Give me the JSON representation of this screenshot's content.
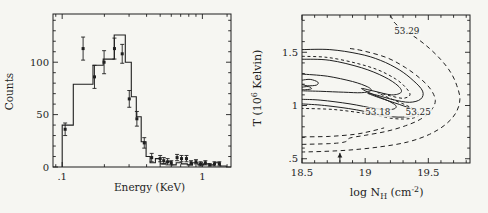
{
  "figure": {
    "background": "#f6f6f2",
    "ink": "#1f1f1f"
  },
  "chart_data": [
    {
      "type": "bar",
      "subtype": "step-histogram-with-errorbar-points",
      "panel": "left",
      "title": "",
      "xlabel": "Energy (KeV)",
      "ylabel": "Counts",
      "xscale": "log",
      "xlim": [
        0.086,
        1.6
      ],
      "ylim": [
        0,
        146
      ],
      "grid": false,
      "xticks_major": [
        {
          "value": 0.1,
          "label": ".1"
        },
        {
          "value": 1,
          "label": "1"
        }
      ],
      "xticks_minor": [
        0.09,
        0.2,
        0.3,
        0.4,
        0.5,
        0.6,
        0.7,
        0.8,
        0.9,
        1.5
      ],
      "yticks_major": [
        {
          "value": 0,
          "label": "0"
        },
        {
          "value": 50,
          "label": "50"
        },
        {
          "value": 100,
          "label": "100"
        }
      ],
      "yticks_minor": [
        10,
        20,
        30,
        40,
        60,
        70,
        80,
        90,
        110,
        120,
        130,
        140
      ],
      "histogram": {
        "bin_edges": [
          0.1,
          0.12,
          0.166,
          0.196,
          0.235,
          0.282,
          0.311,
          0.338,
          0.366,
          0.397,
          0.424,
          0.462,
          0.5,
          0.55,
          0.6,
          0.65,
          0.71,
          0.78,
          0.85,
          0.93,
          1.02,
          1.12,
          1.22,
          1.34,
          1.48
        ],
        "counts": [
          40,
          79,
          97,
          103,
          126,
          100,
          67,
          48,
          24,
          10,
          4,
          8,
          3,
          5,
          2,
          4,
          3,
          2,
          4,
          2,
          3,
          2,
          4,
          1
        ]
      },
      "points": {
        "x": [
          0.105,
          0.141,
          0.17,
          0.199,
          0.236,
          0.268,
          0.301,
          0.341,
          0.385,
          0.435,
          0.5,
          0.53,
          0.565,
          0.6,
          0.66,
          0.71,
          0.77,
          0.83,
          0.9,
          0.97,
          1.05,
          1.13,
          1.22,
          1.32
        ],
        "y": [
          36,
          113,
          86,
          100,
          113,
          108,
          65,
          46,
          23,
          9,
          8,
          6,
          5,
          4,
          9,
          8,
          8,
          4,
          5,
          3,
          4,
          2,
          3,
          3
        ],
        "yerr": [
          6,
          11,
          11,
          11,
          10,
          9,
          8,
          7,
          5,
          4,
          3,
          3,
          3,
          2,
          3,
          3,
          3,
          2,
          2,
          2,
          2,
          1,
          2,
          2
        ]
      }
    },
    {
      "type": "line",
      "subtype": "contour-map",
      "panel": "right",
      "title": "",
      "xlabel": "log N_H (cm^-2)",
      "xlabel_parts": [
        {
          "t": "log N"
        },
        {
          "t": "H",
          "shift": "sub"
        },
        {
          "t": " (cm"
        },
        {
          "t": "-2",
          "shift": "sup"
        },
        {
          "t": ")"
        }
      ],
      "ylabel": "T (10^6 Kelvin)",
      "ylabel_parts": [
        {
          "t": "T (10"
        },
        {
          "t": "6",
          "shift": "sup"
        },
        {
          "t": " Kelvin)"
        }
      ],
      "xlim": [
        18.5,
        19.83
      ],
      "ylim": [
        0.46,
        1.85
      ],
      "grid": false,
      "xticks_major": [
        {
          "value": 18.5,
          "label": "18.5"
        },
        {
          "value": 19,
          "label": "19"
        },
        {
          "value": 19.5,
          "label": "19.5"
        }
      ],
      "xticks_minor": [
        18.6,
        18.7,
        18.8,
        18.9,
        19.1,
        19.2,
        19.3,
        19.4,
        19.6,
        19.7,
        19.8
      ],
      "yticks_major": [
        {
          "value": 0.5,
          "label": ".5"
        },
        {
          "value": 1,
          "label": "1"
        },
        {
          "value": 1.5,
          "label": "1.5"
        }
      ],
      "yticks_minor": [
        0.6,
        0.7,
        0.8,
        0.9,
        1.1,
        1.2,
        1.3,
        1.4,
        1.6,
        1.7,
        1.8
      ],
      "contour_labels": [
        {
          "text": "53.29",
          "x": 19.33,
          "y": 1.7
        },
        {
          "text": "53.18",
          "x": 19.1,
          "y": 0.935
        },
        {
          "text": "53.25",
          "x": 19.42,
          "y": 0.935
        }
      ],
      "arrow_marker": {
        "x": 18.8,
        "y_base": 0.468,
        "y_tip": 0.555
      },
      "contours": [
        {
          "id": "solid-outer",
          "style": "solid",
          "points": [
            [
              18.5,
              1.525
            ],
            [
              18.72,
              1.525
            ],
            [
              18.95,
              1.485
            ],
            [
              19.12,
              1.425
            ],
            [
              19.27,
              1.335
            ],
            [
              19.38,
              1.235
            ],
            [
              19.455,
              1.135
            ],
            [
              19.44,
              1.06
            ],
            [
              19.35,
              1.03
            ],
            [
              19.22,
              1.055
            ],
            [
              19.1,
              1.095
            ],
            [
              19.02,
              1.115
            ],
            [
              19.12,
              1.07
            ],
            [
              19.27,
              1.01
            ],
            [
              19.37,
              0.965
            ],
            [
              19.405,
              0.925
            ],
            [
              19.33,
              0.893
            ],
            [
              19.17,
              0.9
            ],
            [
              18.93,
              0.96
            ],
            [
              18.68,
              1.0
            ],
            [
              18.5,
              1.015
            ]
          ]
        },
        {
          "id": "solid-middle",
          "style": "solid",
          "points": [
            [
              18.5,
              1.435
            ],
            [
              18.72,
              1.425
            ],
            [
              18.97,
              1.355
            ],
            [
              19.15,
              1.27
            ],
            [
              19.26,
              1.185
            ],
            [
              19.285,
              1.125
            ],
            [
              19.21,
              1.1
            ],
            [
              19.07,
              1.135
            ],
            [
              18.97,
              1.16
            ],
            [
              19.06,
              1.105
            ],
            [
              19.18,
              1.045
            ],
            [
              19.245,
              0.995
            ],
            [
              19.21,
              0.963
            ],
            [
              19.08,
              0.972
            ],
            [
              18.88,
              1.015
            ],
            [
              18.65,
              1.05
            ],
            [
              18.5,
              1.058
            ]
          ]
        },
        {
          "id": "solid-inner",
          "style": "solid",
          "points": [
            [
              18.5,
              1.295
            ],
            [
              18.7,
              1.275
            ],
            [
              18.9,
              1.225
            ],
            [
              19.02,
              1.175
            ],
            [
              19.045,
              1.14
            ],
            [
              18.97,
              1.12
            ],
            [
              18.83,
              1.125
            ],
            [
              18.65,
              1.133
            ],
            [
              18.5,
              1.138
            ]
          ]
        },
        {
          "id": "solid-core",
          "style": "solid",
          "points": [
            [
              18.5,
              1.238
            ],
            [
              18.565,
              1.245
            ],
            [
              18.625,
              1.22
            ],
            [
              18.615,
              1.192
            ],
            [
              18.545,
              1.185
            ],
            [
              18.5,
              1.197
            ]
          ]
        },
        {
          "id": "solid-core-small",
          "style": "solid",
          "points": [
            [
              18.5,
              1.172
            ],
            [
              18.55,
              1.178
            ],
            [
              18.575,
              1.158
            ],
            [
              18.53,
              1.148
            ],
            [
              18.5,
              1.152
            ]
          ]
        },
        {
          "id": "dash-weave",
          "style": "dash-short",
          "points": [
            [
              18.5,
              1.462
            ],
            [
              18.7,
              1.452
            ],
            [
              18.92,
              1.4
            ],
            [
              19.1,
              1.335
            ],
            [
              19.24,
              1.25
            ],
            [
              19.32,
              1.17
            ],
            [
              19.355,
              1.1
            ],
            [
              19.3,
              1.068
            ],
            [
              19.2,
              1.09
            ],
            [
              19.1,
              1.12
            ],
            [
              19.22,
              1.055
            ],
            [
              19.33,
              1.0
            ],
            [
              19.405,
              0.95
            ],
            [
              19.43,
              0.91
            ],
            [
              19.36,
              0.878
            ],
            [
              19.22,
              0.878
            ],
            [
              19.0,
              0.925
            ],
            [
              18.75,
              0.962
            ],
            [
              18.5,
              0.973
            ]
          ]
        },
        {
          "id": "dash-53-25",
          "style": "dash",
          "points": [
            [
              18.5,
              0.635
            ],
            [
              18.72,
              0.642
            ],
            [
              18.84,
              0.658
            ],
            [
              18.88,
              0.695
            ],
            [
              19.0,
              0.72
            ],
            [
              19.17,
              0.758
            ],
            [
              19.32,
              0.81
            ],
            [
              19.44,
              0.872
            ],
            [
              19.52,
              0.95
            ],
            [
              19.555,
              1.045
            ],
            [
              19.52,
              1.15
            ],
            [
              19.44,
              1.25
            ],
            [
              19.32,
              1.355
            ],
            [
              19.17,
              1.45
            ],
            [
              18.98,
              1.515
            ],
            [
              18.88,
              1.535
            ]
          ]
        },
        {
          "id": "dash-53-29",
          "style": "dash",
          "points": [
            [
              19.2,
              1.85
            ],
            [
              19.235,
              1.775
            ],
            [
              19.3,
              1.715
            ],
            [
              19.41,
              1.63
            ],
            [
              19.51,
              1.535
            ],
            [
              19.6,
              1.43
            ],
            [
              19.675,
              1.315
            ],
            [
              19.725,
              1.19
            ],
            [
              19.75,
              1.06
            ],
            [
              19.72,
              0.935
            ],
            [
              19.64,
              0.825
            ],
            [
              19.51,
              0.73
            ],
            [
              19.34,
              0.658
            ],
            [
              19.12,
              0.612
            ],
            [
              18.88,
              0.582
            ],
            [
              18.65,
              0.568
            ],
            [
              18.5,
              0.563
            ]
          ]
        },
        {
          "id": "dash-lower-left",
          "style": "dash",
          "points": [
            [
              18.5,
              0.705
            ],
            [
              18.72,
              0.71
            ],
            [
              18.92,
              0.73
            ],
            [
              19.05,
              0.76
            ],
            [
              19.15,
              0.79
            ]
          ]
        }
      ]
    }
  ]
}
